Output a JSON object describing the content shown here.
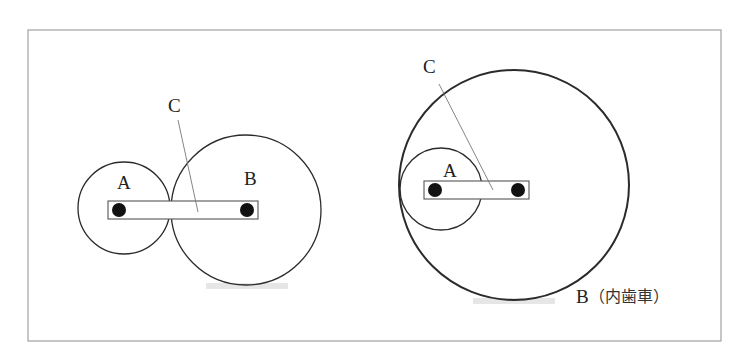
{
  "diagram": {
    "type": "gear-train-comparison",
    "frame": {
      "x": 28,
      "y": 30,
      "width": 693,
      "height": 311,
      "stroke": "#a8a8a8"
    },
    "colors": {
      "line": "#2b2b2b",
      "thin_line": "#777777",
      "fill_dot": "#111111",
      "artifact": "#e6e6e6"
    },
    "left_figure": {
      "name": "external-gear-pair",
      "gear_a": {
        "label": "A",
        "cx": 124,
        "cy": 208,
        "r": 46
      },
      "gear_b": {
        "label": "B",
        "cx": 246,
        "cy": 210,
        "r": 75
      },
      "arm": {
        "label": "C",
        "x": 108,
        "y": 201,
        "width": 150,
        "height": 18
      },
      "labels": {
        "a": {
          "text": "A",
          "x": 124,
          "y": 193
        },
        "b": {
          "text": "B",
          "x": 252,
          "y": 189
        },
        "c": {
          "text": "C",
          "x": 175,
          "y": 115
        }
      },
      "leader_c": {
        "x1": 178,
        "y1": 120,
        "x2": 198,
        "y2": 212
      }
    },
    "right_figure": {
      "name": "internal-gear-pair",
      "gear_a": {
        "label": "A",
        "cx": 441,
        "cy": 189,
        "r": 41
      },
      "gear_b": {
        "label": "B（内歯車）",
        "cx": 514,
        "cy": 185,
        "r": 115
      },
      "arm": {
        "label": "C",
        "x": 424,
        "y": 181,
        "width": 105,
        "height": 18
      },
      "labels": {
        "a": {
          "text": "A",
          "x": 451,
          "y": 180
        },
        "b": {
          "text": "B",
          "x": 577,
          "y": 305
        },
        "b_note": {
          "text": "（内歯車）",
          "x": 590,
          "y": 305
        },
        "c": {
          "text": "C",
          "x": 430,
          "y": 75
        }
      },
      "leader_c": {
        "x1": 439,
        "y1": 84,
        "x2": 493,
        "y2": 190
      }
    }
  }
}
